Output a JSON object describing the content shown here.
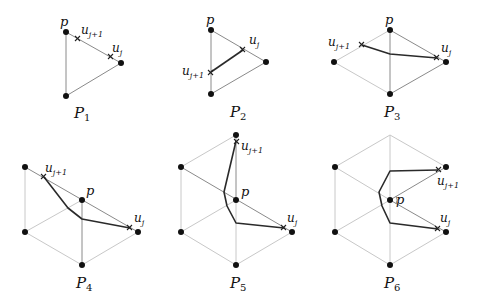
{
  "figure": {
    "panels": [
      {
        "id": "P1",
        "caption": "P",
        "caption_sub": "1",
        "labels": {
          "p": "p",
          "uj": "u",
          "uj_sub": "j",
          "uj1": "u",
          "uj1_sub": "j+1"
        }
      },
      {
        "id": "P2",
        "caption": "P",
        "caption_sub": "2",
        "labels": {
          "p": "p",
          "uj": "u",
          "uj_sub": "j",
          "uj1": "u",
          "uj1_sub": "j+1"
        }
      },
      {
        "id": "P3",
        "caption": "P",
        "caption_sub": "3",
        "labels": {
          "p": "p",
          "uj": "u",
          "uj_sub": "j",
          "uj1": "u",
          "uj1_sub": "j+1"
        }
      },
      {
        "id": "P4",
        "caption": "P",
        "caption_sub": "4",
        "labels": {
          "p": "p",
          "uj": "u",
          "uj_sub": "j",
          "uj1": "u",
          "uj1_sub": "j+1"
        }
      },
      {
        "id": "P5",
        "caption": "P",
        "caption_sub": "5",
        "labels": {
          "p": "p",
          "uj": "u",
          "uj_sub": "j",
          "uj1": "u",
          "uj1_sub": "j+1"
        }
      },
      {
        "id": "P6",
        "caption": "P",
        "caption_sub": "6",
        "labels": {
          "p": "p",
          "uj": "u",
          "uj_sub": "j",
          "uj1": "u",
          "uj1_sub": "j+1"
        }
      }
    ]
  },
  "colors": {
    "vertex": "#111111",
    "light_edge": "#c8c8c8",
    "mid_edge": "#8a8a8a",
    "dark_path": "#2a2a2a"
  }
}
